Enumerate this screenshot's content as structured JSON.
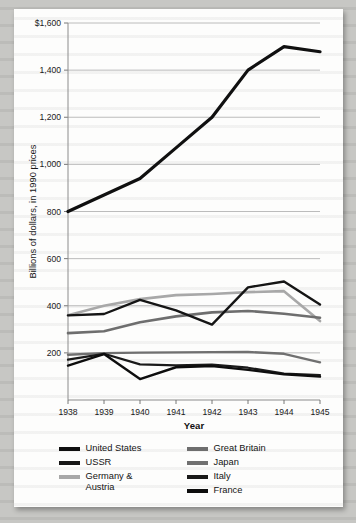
{
  "chart_data": {
    "type": "line",
    "title": "",
    "xlabel": "Year",
    "ylabel": "Billions of dollars, in 1990 prices",
    "x": [
      1938,
      1939,
      1940,
      1941,
      1942,
      1943,
      1944,
      1945
    ],
    "xtick_labels": [
      "1938",
      "1939",
      "1940",
      "1941",
      "1942",
      "1943",
      "1944",
      "1945"
    ],
    "ytick_labels": [
      "200",
      "400",
      "600",
      "800",
      "1,000",
      "1,200",
      "1,400",
      "$1,600"
    ],
    "ytick_values": [
      200,
      400,
      600,
      800,
      1000,
      1200,
      1400,
      1600
    ],
    "ylim": [
      0,
      1600
    ],
    "xlim": [
      1938,
      1945
    ],
    "grid": "horizontal",
    "legend_position": "bottom",
    "series": [
      {
        "name": "United States",
        "color": "#101010",
        "width": 3.2,
        "values": [
          800,
          870,
          940,
          1070,
          1200,
          1400,
          1500,
          1478
        ]
      },
      {
        "name": "USSR",
        "color": "#151515",
        "width": 2.4,
        "values": [
          359,
          365,
          425,
          380,
          320,
          478,
          503,
          405
        ]
      },
      {
        "name": "Germany & Austria",
        "color": "#a8a8a8",
        "width": 2.6,
        "values": [
          360,
          400,
          428,
          445,
          450,
          458,
          462,
          335
        ]
      },
      {
        "name": "Great Britain",
        "color": "#6e6e6e",
        "width": 2.6,
        "values": [
          284,
          292,
          330,
          355,
          372,
          378,
          366,
          349
        ]
      },
      {
        "name": "Japan",
        "color": "#707070",
        "width": 2.4,
        "values": [
          192,
          199,
          201,
          202,
          203,
          204,
          196,
          160
        ]
      },
      {
        "name": "Italy",
        "color": "#1a1a1a",
        "width": 2.2,
        "values": [
          171,
          196,
          151,
          147,
          150,
          137,
          112,
          106
        ]
      },
      {
        "name": "France",
        "color": "#0d0d0d",
        "width": 2.4,
        "values": [
          146,
          195,
          89,
          139,
          144,
          128,
          109,
          99
        ]
      }
    ],
    "legend_entries": [
      {
        "label": "United States",
        "color": "#101010"
      },
      {
        "label": "USSR",
        "color": "#151515"
      },
      {
        "label": "Germany &\nAustria",
        "color": "#a8a8a8"
      },
      {
        "label": "Great Britain",
        "color": "#6e6e6e"
      },
      {
        "label": "Japan",
        "color": "#707070"
      },
      {
        "label": "Italy",
        "color": "#1a1a1a"
      },
      {
        "label": "France",
        "color": "#0d0d0d"
      }
    ]
  }
}
